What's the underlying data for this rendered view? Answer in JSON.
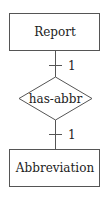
{
  "diagram": {
    "type": "er-diagram",
    "colors": {
      "stroke": "#555555",
      "text": "#222222",
      "background": "#ffffff"
    },
    "entities": [
      {
        "id": "report",
        "label": "Report"
      },
      {
        "id": "abbreviation",
        "label": "Abbreviation"
      }
    ],
    "relationships": [
      {
        "id": "has-abbr",
        "label": "has-abbr"
      }
    ],
    "connections": [
      {
        "from": "report",
        "to": "has-abbr",
        "cardinality": "1"
      },
      {
        "from": "has-abbr",
        "to": "abbreviation",
        "cardinality": "1"
      }
    ]
  }
}
